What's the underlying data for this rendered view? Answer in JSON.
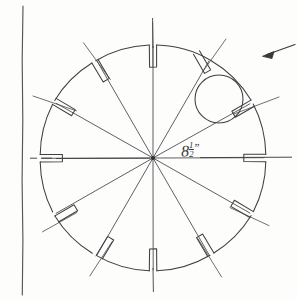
{
  "document": {
    "type": "hand-drawn engineering sketch",
    "title": "Slotted Circular Plate",
    "paper_color": "#fdfdfc",
    "ink_color": "#3a3a3a"
  },
  "drawing": {
    "page_edge": {
      "name": "page edge line",
      "orientation": "vertical",
      "x": 22,
      "y_start": 6,
      "y_end": 295
    },
    "plate": {
      "name": "slotted circular plate",
      "center_x": 153,
      "center_y": 158,
      "radius": 113,
      "slot_count": 12,
      "slot_angle_step_deg": 30,
      "slot_length": 22,
      "slot_width": 7,
      "spoke_count": 12
    },
    "bore_circle": {
      "name": "bore circle",
      "center_x": 219,
      "center_y": 99,
      "radius": 24
    },
    "dimension": {
      "name": "diameter dimension",
      "whole": "8",
      "fraction_numerator": "1",
      "fraction_denominator": "2",
      "unit_mark": "”",
      "text": "8½”",
      "label_x": 181,
      "label_y": 141
    },
    "centerline": {
      "name": "horizontal centerline",
      "y": 158,
      "x_start": 8,
      "x_end": 292,
      "dashed_left": true
    },
    "leader_arrow": {
      "name": "leader arrow",
      "direction": "left",
      "tip_x": 263,
      "tip_y": 56,
      "tail_x": 295,
      "tail_y": 44
    }
  },
  "annotations": {
    "notes": []
  }
}
